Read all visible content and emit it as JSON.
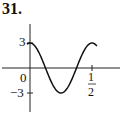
{
  "problem_number": "31.",
  "chart_data": {
    "type": "line",
    "title": "",
    "function": "y = 3 cos(4πx)",
    "xlabel": "",
    "ylabel": "",
    "x_ticks": [
      {
        "value": 0.5,
        "label": "1/2"
      }
    ],
    "y_ticks": [
      {
        "value": 3,
        "label": "3"
      },
      {
        "value": -3,
        "label": "−3"
      }
    ],
    "origin_label": "0",
    "xlim": [
      -0.2,
      0.62
    ],
    "ylim": [
      -5,
      5.5
    ],
    "grid": false,
    "legend": null,
    "series": [
      {
        "name": "curve",
        "x": [
          0,
          0.0625,
          0.125,
          0.1875,
          0.25,
          0.3125,
          0.375,
          0.4375,
          0.5
        ],
        "values": [
          3,
          2.12,
          0,
          -2.12,
          -3,
          -2.12,
          0,
          2.12,
          3
        ]
      }
    ]
  },
  "labels": {
    "y_top": "3",
    "y_bottom": "−3",
    "origin": "0",
    "x_num": "1",
    "x_den": "2"
  }
}
